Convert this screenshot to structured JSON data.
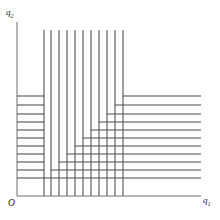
{
  "figure": {
    "background_color": "#ffffff",
    "width": 220,
    "height": 220
  },
  "axes": {
    "origin_label": "O",
    "x_axis": {
      "label": "q",
      "subscript": "1",
      "color": "#6e6e6e",
      "x_start": 17,
      "x_end": 201,
      "y": 196
    },
    "y_axis": {
      "label": "q",
      "subscript": "2",
      "color": "#6e6e6e",
      "x": 17,
      "y_start": 22,
      "y_end": 196
    }
  },
  "chart_data": {
    "type": "line",
    "xlabel": "q1",
    "ylabel": "q2",
    "grid": false,
    "legend": false,
    "curve_shape": "L-shaped right angle (Leontief / perfect complements)",
    "curve_color": "#4a4a4a",
    "curve_width": 1.05,
    "curve_count": 11,
    "kink_ray_note": "Corners of the L-shaped curves lie on a ray from the origin",
    "curves": [
      {
        "index": 1,
        "corner_x": 44,
        "corner_y": 178,
        "vertical_top": 30,
        "horizontal_right": 201
      },
      {
        "index": 2,
        "corner_x": 51,
        "corner_y": 170,
        "vertical_top": 30,
        "horizontal_right": 201
      },
      {
        "index": 3,
        "corner_x": 59,
        "corner_y": 162,
        "vertical_top": 30,
        "horizontal_right": 201
      },
      {
        "index": 4,
        "corner_x": 67,
        "corner_y": 154,
        "vertical_top": 30,
        "horizontal_right": 201
      },
      {
        "index": 5,
        "corner_x": 75,
        "corner_y": 146,
        "vertical_top": 30,
        "horizontal_right": 201
      },
      {
        "index": 6,
        "corner_x": 83,
        "corner_y": 138,
        "vertical_top": 30,
        "horizontal_right": 201
      },
      {
        "index": 7,
        "corner_x": 91,
        "corner_y": 130,
        "vertical_top": 30,
        "horizontal_right": 201
      },
      {
        "index": 8,
        "corner_x": 99,
        "corner_y": 122,
        "vertical_top": 30,
        "horizontal_right": 201
      },
      {
        "index": 9,
        "corner_x": 107,
        "corner_y": 114,
        "vertical_top": 30,
        "horizontal_right": 201
      },
      {
        "index": 10,
        "corner_x": 115,
        "corner_y": 105,
        "vertical_top": 30,
        "horizontal_right": 201
      },
      {
        "index": 11,
        "corner_x": 123,
        "corner_y": 96,
        "vertical_top": 30,
        "horizontal_right": 201
      }
    ],
    "left_horizontal_segments": [
      {
        "index": 1,
        "y": 178,
        "x_start": 17,
        "x_end": 44
      },
      {
        "index": 2,
        "y": 170,
        "x_start": 17,
        "x_end": 44
      },
      {
        "index": 3,
        "y": 162,
        "x_start": 17,
        "x_end": 44
      },
      {
        "index": 4,
        "y": 154,
        "x_start": 17,
        "x_end": 44
      },
      {
        "index": 5,
        "y": 146,
        "x_start": 17,
        "x_end": 44
      },
      {
        "index": 6,
        "y": 138,
        "x_start": 17,
        "x_end": 44
      },
      {
        "index": 7,
        "y": 130,
        "x_start": 17,
        "x_end": 44
      },
      {
        "index": 8,
        "y": 122,
        "x_start": 17,
        "x_end": 44
      },
      {
        "index": 9,
        "y": 114,
        "x_start": 17,
        "x_end": 44
      },
      {
        "index": 10,
        "y": 105,
        "x_start": 17,
        "x_end": 44
      },
      {
        "index": 11,
        "y": 96,
        "x_start": 17,
        "x_end": 44
      }
    ],
    "bottom_vertical_segments": [
      {
        "index": 1,
        "x": 44,
        "y_start": 178,
        "y_end": 196
      },
      {
        "index": 2,
        "x": 51,
        "y_start": 170,
        "y_end": 196
      },
      {
        "index": 3,
        "x": 59,
        "y_start": 162,
        "y_end": 196
      },
      {
        "index": 4,
        "x": 67,
        "y_start": 154,
        "y_end": 196
      },
      {
        "index": 5,
        "x": 75,
        "y_start": 146,
        "y_end": 196
      },
      {
        "index": 6,
        "x": 83,
        "y_start": 138,
        "y_end": 196
      },
      {
        "index": 7,
        "x": 91,
        "y_start": 130,
        "y_end": 196
      },
      {
        "index": 8,
        "x": 99,
        "y_start": 122,
        "y_end": 196
      },
      {
        "index": 9,
        "x": 107,
        "y_start": 114,
        "y_end": 196
      },
      {
        "index": 10,
        "x": 115,
        "y_start": 105,
        "y_end": 196
      },
      {
        "index": 11,
        "x": 123,
        "y_start": 96,
        "y_end": 196
      }
    ]
  }
}
